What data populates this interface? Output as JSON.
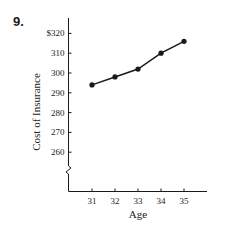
{
  "problem_number": "9.",
  "chart_data": {
    "type": "line",
    "title": "",
    "xlabel": "Age",
    "ylabel": "Cost of Insurance",
    "x": [
      31,
      32,
      33,
      34,
      35
    ],
    "values": [
      294,
      298,
      302,
      310,
      316
    ],
    "x_tick_labels": [
      "31",
      "32",
      "33",
      "34",
      "35"
    ],
    "y_tick_labels": [
      "$320",
      "310",
      "300",
      "290",
      "280",
      "270",
      "260"
    ],
    "y_ticks": [
      320,
      310,
      300,
      290,
      280,
      270,
      260
    ],
    "ylim": [
      250,
      328
    ],
    "y_axis_break": true,
    "grid": false,
    "legend": null,
    "line_color": "#1a1a1a"
  }
}
